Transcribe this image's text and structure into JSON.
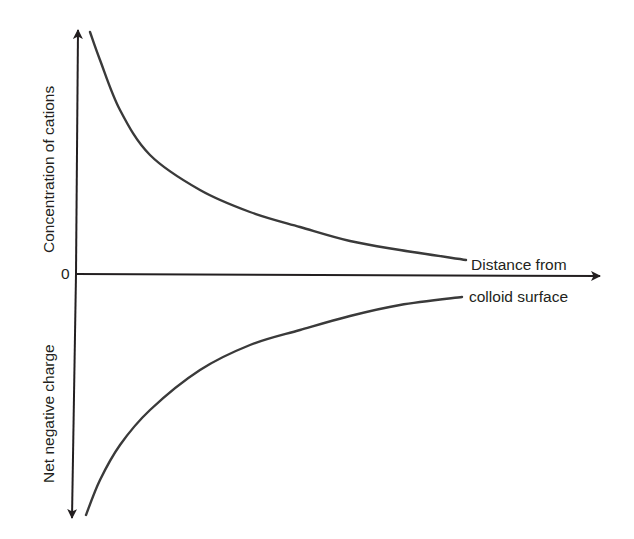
{
  "diagram": {
    "type": "schematic-graph",
    "topic": "Cation concentration and net negative charge vs distance from colloid surface",
    "colors": {
      "ink": "#231f20",
      "curve": "#3a3a3a",
      "background": "#ffffff"
    },
    "axes": {
      "origin_label": "0",
      "y_positive_label": "Concentration of cations",
      "y_negative_label": "Net negative charge",
      "x_label_line1": "Distance from",
      "x_label_line2": "colloid surface"
    },
    "curves": [
      {
        "name": "cation-concentration-curve",
        "description": "Decays from high near the surface toward zero with distance",
        "points_px": [
          [
            90,
            32
          ],
          [
            100,
            60
          ],
          [
            120,
            110
          ],
          [
            150,
            155
          ],
          [
            200,
            190
          ],
          [
            250,
            212
          ],
          [
            300,
            227
          ],
          [
            350,
            241
          ],
          [
            400,
            250
          ],
          [
            466,
            260
          ]
        ]
      },
      {
        "name": "net-negative-charge-curve",
        "description": "Strongly negative near the surface, rising toward zero with distance",
        "points_px": [
          [
            86,
            515
          ],
          [
            100,
            480
          ],
          [
            120,
            445
          ],
          [
            150,
            410
          ],
          [
            200,
            370
          ],
          [
            250,
            345
          ],
          [
            300,
            330
          ],
          [
            350,
            316
          ],
          [
            400,
            305
          ],
          [
            462,
            297
          ]
        ]
      }
    ]
  }
}
